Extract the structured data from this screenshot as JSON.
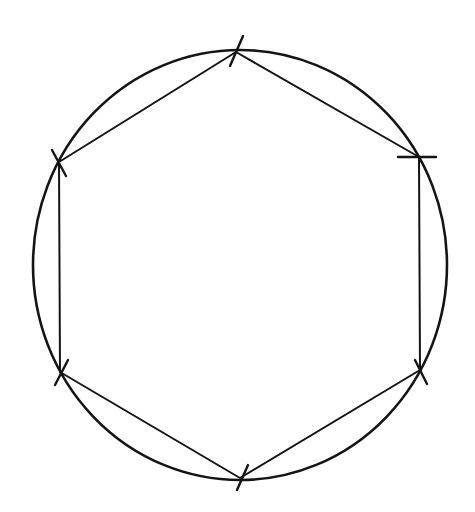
{
  "diagram": {
    "type": "geometric-construction",
    "stroke_color": "#141414",
    "background": "#ffffff",
    "circle": {
      "cx": 240,
      "cy": 265,
      "rx": 207,
      "ry": 215,
      "stroke_width": 2.6
    },
    "hexagon": {
      "stroke_width": 2,
      "vertices": [
        {
          "name": "top",
          "x": 236,
          "y": 52
        },
        {
          "name": "upper-right",
          "x": 419,
          "y": 157
        },
        {
          "name": "lower-right",
          "x": 420,
          "y": 370
        },
        {
          "name": "bottom",
          "x": 240,
          "y": 478
        },
        {
          "name": "lower-left",
          "x": 60,
          "y": 372
        },
        {
          "name": "upper-left",
          "x": 59,
          "y": 162
        }
      ]
    },
    "tick_marks": [
      {
        "at": "top",
        "x1": 230,
        "y1": 66,
        "x2": 243,
        "y2": 36
      },
      {
        "at": "upper-right",
        "x1": 398,
        "y1": 157,
        "x2": 436,
        "y2": 157
      },
      {
        "at": "lower-right",
        "x1": 415,
        "y1": 360,
        "x2": 427,
        "y2": 384
      },
      {
        "at": "bottom",
        "x1": 237,
        "y1": 490,
        "x2": 248,
        "y2": 465
      },
      {
        "at": "lower-left",
        "x1": 55,
        "y1": 385,
        "x2": 68,
        "y2": 360
      },
      {
        "at": "upper-left",
        "x1": 52,
        "y1": 150,
        "x2": 66,
        "y2": 176
      }
    ]
  }
}
